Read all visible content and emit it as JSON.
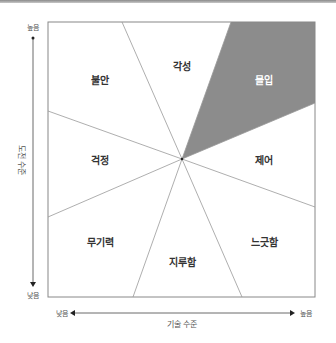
{
  "diagram": {
    "colors": {
      "border": "#888888",
      "lines": "#999999",
      "flow_fill": "#8c8c8c",
      "text": "#333333",
      "flow_text": "#ffffff"
    },
    "axes": {
      "y": {
        "title": "도전 수준",
        "high_label": "높음",
        "low_label": "낮음"
      },
      "x": {
        "title": "기술 수준",
        "high_label": "높음",
        "low_label": "낮음"
      }
    },
    "regions": [
      {
        "id": "arousal",
        "label": "각성"
      },
      {
        "id": "flow",
        "label": "몰입",
        "highlighted": true
      },
      {
        "id": "anxiety",
        "label": "불안"
      },
      {
        "id": "worry",
        "label": "걱정"
      },
      {
        "id": "control",
        "label": "제어"
      },
      {
        "id": "apathy",
        "label": "무기력"
      },
      {
        "id": "boredom",
        "label": "지루함"
      },
      {
        "id": "relaxation",
        "label": "느긋함"
      }
    ]
  }
}
